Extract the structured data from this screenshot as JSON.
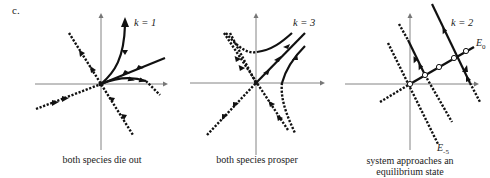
{
  "figure": {
    "panel_label": "c.",
    "panels": [
      {
        "id": "k1",
        "k_label": "k = 1",
        "caption": "both species die out",
        "description": "Stable node at origin; all trajectories approach origin"
      },
      {
        "id": "k3",
        "k_label": "k = 3",
        "caption": "both species prosper",
        "description": "Saddle point at origin; trajectories move away along unstable direction"
      },
      {
        "id": "k2",
        "k_label": "k = 2",
        "caption_line1": "system approaches an",
        "caption_line2": "equilibrium state",
        "line_labels": {
          "e0_main": "E",
          "e0_sub": "0",
          "em5_main": "E",
          "em5_sub": "-5"
        },
        "description": "Line of equilibria E0; trajectories along parallel lines approach it"
      }
    ]
  }
}
